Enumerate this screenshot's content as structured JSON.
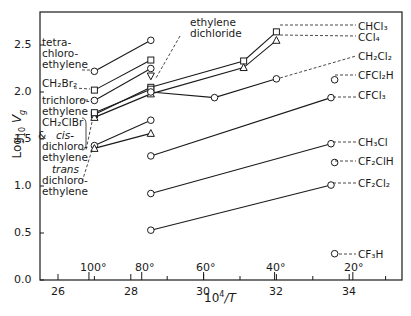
{
  "chart_data": {
    "type": "line",
    "title": "",
    "xlabel": "10^4/T",
    "ylabel": "Log10 Vg",
    "xlim": [
      25.5,
      35.3
    ],
    "ylim": [
      0.0,
      2.85
    ],
    "x_ticks": [
      "26",
      "28",
      "30",
      "32",
      "34"
    ],
    "y_ticks": [
      "0.0",
      "0.5",
      "1.0",
      "1.5",
      "2.0",
      "2.5"
    ],
    "secondary_x_ticks": [
      {
        "label": "100°",
        "x": 26.85
      },
      {
        "label": "80°",
        "x": 28.3
      },
      {
        "label": "60°",
        "x": 30.0
      },
      {
        "label": "40°",
        "x": 31.95
      },
      {
        "label": "20°",
        "x": 34.1
      }
    ],
    "grid": false,
    "legend": "inline labels",
    "series": [
      {
        "name": "tetrachloroethylene",
        "marker": "circle",
        "x": [
          27.0,
          28.55
        ],
        "y": [
          2.22,
          2.55
        ]
      },
      {
        "name": "CH2Br2",
        "marker": "square",
        "x": [
          27.0,
          28.55
        ],
        "y": [
          2.02,
          2.34
        ]
      },
      {
        "name": "trichloroethylene",
        "marker": "circle",
        "x": [
          27.0,
          28.55
        ],
        "y": [
          1.91,
          2.25
        ]
      },
      {
        "name": "ethylene dichloride",
        "marker": "triangle-down",
        "x": [
          28.55
        ],
        "y": [
          2.17
        ]
      },
      {
        "name": "CHCl3",
        "marker": "square",
        "x": [
          27.0,
          28.55,
          31.1,
          32.0
        ],
        "y": [
          1.76,
          2.05,
          2.33,
          2.64
        ]
      },
      {
        "name": "CCl4",
        "marker": "triangle",
        "x": [
          27.0,
          28.55,
          31.1,
          32.0
        ],
        "y": [
          1.73,
          1.98,
          2.26,
          2.55
        ]
      },
      {
        "name": "CH2ClBr",
        "marker": "square",
        "x": [
          27.0,
          28.55
        ],
        "y": [
          1.78,
          2.03
        ]
      },
      {
        "name": "CH2Cl2",
        "marker": "circle",
        "x": [
          28.55,
          30.3,
          32.0
        ],
        "y": [
          2.0,
          1.94,
          2.14
        ]
      },
      {
        "name": "cis-dichloroethylene",
        "marker": "circle",
        "x": [
          27.0,
          28.55
        ],
        "y": [
          1.43,
          1.7
        ]
      },
      {
        "name": "trans-dichloroethylene",
        "marker": "triangle",
        "x": [
          27.0,
          28.55
        ],
        "y": [
          1.4,
          1.56
        ]
      },
      {
        "name": "CFCl2H",
        "marker": "circle",
        "x": [
          33.6
        ],
        "y": [
          2.13
        ]
      },
      {
        "name": "CFCl3",
        "marker": "circle",
        "x": [
          28.55,
          33.5
        ],
        "y": [
          1.32,
          1.94
        ]
      },
      {
        "name": "CH3Cl",
        "marker": "circle",
        "x": [
          28.55,
          33.5
        ],
        "y": [
          0.92,
          1.45
        ]
      },
      {
        "name": "CF2ClH",
        "marker": "circle",
        "x": [
          33.6
        ],
        "y": [
          1.25
        ]
      },
      {
        "name": "CF2Cl2",
        "marker": "circle",
        "x": [
          28.55,
          33.5
        ],
        "y": [
          0.53,
          1.01
        ]
      },
      {
        "name": "CF3H",
        "marker": "circle",
        "x": [
          33.6
        ],
        "y": [
          0.28
        ]
      }
    ]
  },
  "labels": {
    "tetrachloroethylene": [
      "tetra-",
      "chloro-",
      "ethylene"
    ],
    "ch2br2": "CH₂Br₂",
    "trichloroethylene": [
      "trichloro-",
      "ethylene"
    ],
    "ch2clbr": "CH₂ClBr",
    "and": "&",
    "cis": "cis-",
    "cis_rest": [
      "dichloro-",
      "ethylene"
    ],
    "trans": "trans",
    "trans_rest": [
      "dichloro-",
      "ethylene"
    ],
    "ethylene_dichloride": [
      "ethylene",
      "dichloride"
    ],
    "chcl3": "CHCl₃",
    "ccl4": "CCl₄",
    "ch2cl2": "CH₂Cl₂",
    "cfcl2h": "CFCl₂H",
    "cfcl3": "CFCl₃",
    "ch3cl": "CH₃Cl",
    "cf2clh": "CF₂ClH",
    "cf2cl2": "CF₂Cl₂",
    "cf3h": "CF₃H"
  },
  "axes": {
    "xlabel_base": "10",
    "xlabel_exp": "4",
    "xlabel_tail": "/T",
    "ylabel_base": "Log",
    "ylabel_sub": "10",
    "ylabel_var": "V",
    "ylabel_var_sub": "g",
    "y_ticks": [
      "0.0",
      "0.5",
      "1.0",
      "1.5",
      "2.0",
      "2.5"
    ],
    "x_ticks": [
      "26",
      "28",
      "30",
      "32",
      "34"
    ],
    "temp_ticks": [
      "100°",
      "80°",
      "60°",
      "40°",
      "20°"
    ]
  }
}
